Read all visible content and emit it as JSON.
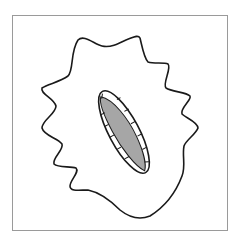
{
  "diagram": {
    "colors": {
      "frame": "#9a9a9a",
      "outline": "#1a1a1a",
      "fill_inner": "#a6a6a6",
      "background": "#ffffff"
    },
    "shapes": [
      {
        "name": "outer-blob",
        "type": "wavy-closed-curve"
      },
      {
        "name": "ellipse-rim",
        "type": "ellipse",
        "tick_count": 12
      },
      {
        "name": "inner-gray-region",
        "type": "lens"
      }
    ]
  }
}
